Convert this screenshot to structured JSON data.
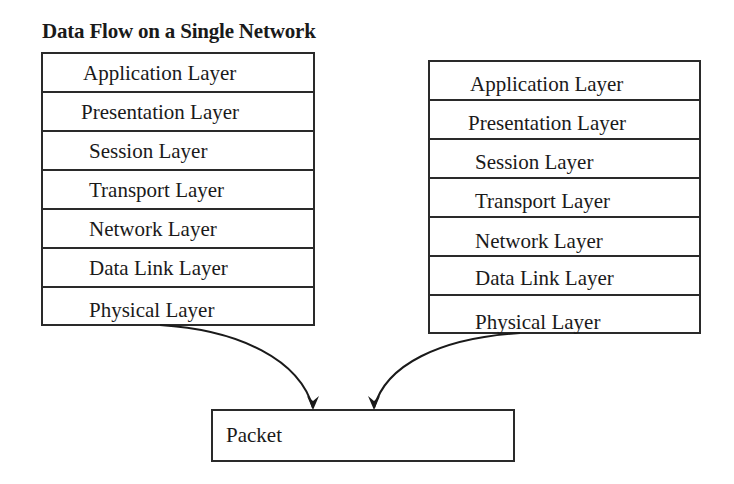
{
  "title": "Data Flow on a Single Network",
  "left_stack": {
    "layers": [
      {
        "label": "Application Layer",
        "indent": 40
      },
      {
        "label": "Presentation Layer",
        "indent": 38
      },
      {
        "label": "Session Layer",
        "indent": 46
      },
      {
        "label": "Transport Layer",
        "indent": 46
      },
      {
        "label": "Network Layer",
        "indent": 46
      },
      {
        "label": "Data Link Layer",
        "indent": 46
      },
      {
        "label": "Physical Layer",
        "indent": 46
      }
    ]
  },
  "right_stack": {
    "layers": [
      {
        "label": "Application Layer",
        "indent": 40
      },
      {
        "label": "Presentation Layer",
        "indent": 38
      },
      {
        "label": "Session Layer",
        "indent": 45
      },
      {
        "label": "Transport Layer",
        "indent": 45
      },
      {
        "label": "Network Layer",
        "indent": 45
      },
      {
        "label": "Data Link Layer",
        "indent": 45
      },
      {
        "label": "Physical Layer",
        "indent": 45
      }
    ]
  },
  "packet": {
    "label": "Packet"
  },
  "arrows": [
    {
      "from": "left_stack.physical",
      "to": "packet"
    },
    {
      "from": "right_stack.physical",
      "to": "packet"
    }
  ]
}
